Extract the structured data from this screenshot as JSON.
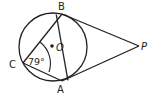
{
  "diagram": {
    "type": "geometry",
    "points": {
      "B": {
        "label": "B",
        "x": 62,
        "y": 14
      },
      "A": {
        "label": "A",
        "x": 62,
        "y": 81
      },
      "C": {
        "label": "C",
        "x": 23,
        "y": 63
      },
      "O": {
        "label": "O",
        "x": 52,
        "y": 46
      },
      "P": {
        "label": "P",
        "x": 139,
        "y": 46
      }
    },
    "circle": {
      "center": "O",
      "cx": 53,
      "cy": 47,
      "r": 34
    },
    "segments": [
      [
        "C",
        "B"
      ],
      [
        "C",
        "A"
      ],
      [
        "B",
        "A"
      ],
      [
        "P",
        "B"
      ],
      [
        "P",
        "A"
      ]
    ],
    "angle": {
      "vertex": "C",
      "label": "79°",
      "value": 79
    }
  },
  "labels": {
    "B": "B",
    "A": "A",
    "C": "C",
    "O": "O",
    "P": "P",
    "angle_C": "79°"
  },
  "colors": {
    "stroke": "#231f20",
    "background": "#ffffff"
  }
}
